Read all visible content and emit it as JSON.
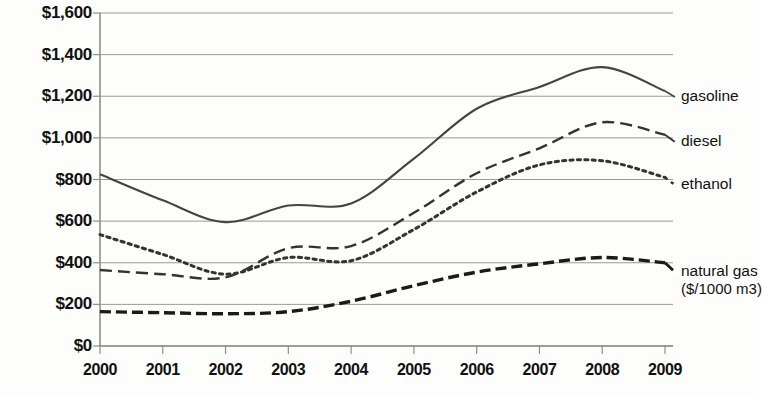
{
  "chart_data": {
    "type": "line",
    "title": "",
    "xlabel": "",
    "ylabel": "",
    "x": [
      2000,
      2001,
      2002,
      2003,
      2004,
      2005,
      2006,
      2007,
      2008,
      2009
    ],
    "xlim": [
      2000,
      2009
    ],
    "ylim": [
      0,
      1600
    ],
    "grid": true,
    "legend_position": "right-inline",
    "y_tick_labels": [
      "$1,600",
      "$1,400",
      "$1,200",
      "$1,000",
      "$800",
      "$600",
      "$400",
      "$200",
      "$0"
    ],
    "y_tick_values": [
      1600,
      1400,
      1200,
      1000,
      800,
      600,
      400,
      200,
      0
    ],
    "x_tick_labels": [
      "2000",
      "2001",
      "2002",
      "2003",
      "2004",
      "2005",
      "2006",
      "2007",
      "2008",
      "2009"
    ],
    "series": [
      {
        "name": "gasoline",
        "label": "gasoline",
        "style": "solid",
        "color": "#444444",
        "values": [
          825,
          700,
          595,
          675,
          685,
          900,
          1140,
          1245,
          1340,
          1225
        ]
      },
      {
        "name": "diesel",
        "label": "diesel",
        "style": "dashed",
        "color": "#333333",
        "values": [
          365,
          345,
          330,
          470,
          480,
          640,
          830,
          950,
          1075,
          1015
        ]
      },
      {
        "name": "ethanol",
        "label": "ethanol",
        "style": "dotted",
        "color": "#333333",
        "values": [
          535,
          440,
          345,
          425,
          410,
          560,
          740,
          870,
          890,
          810
        ]
      },
      {
        "name": "natural gas",
        "label": "natural gas",
        "sublabel": "($/1000 m3)",
        "style": "heavy-dashed",
        "color": "#1a1a1a",
        "values": [
          165,
          160,
          155,
          165,
          215,
          290,
          355,
          395,
          425,
          400
        ]
      }
    ]
  },
  "axis": {
    "y_axis_name": "price-axis",
    "x_axis_name": "year-axis"
  }
}
